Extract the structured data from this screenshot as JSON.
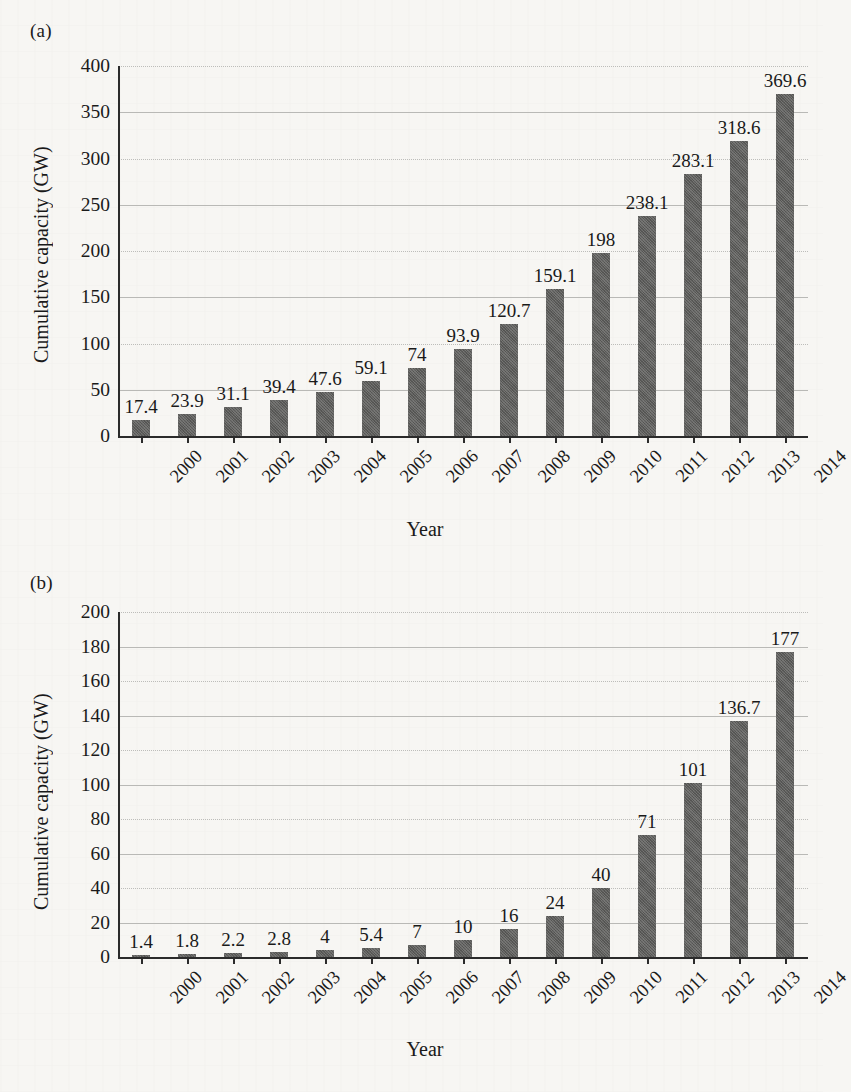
{
  "figure": {
    "panels": [
      {
        "panel_label": "(a)",
        "ylabel": "Cumulative capacity (GW)",
        "xlabel": "Year"
      },
      {
        "panel_label": "(b)",
        "ylabel": "Cumulative capacity (GW)",
        "xlabel": "Year"
      }
    ]
  },
  "chart_data": [
    {
      "type": "bar",
      "panel": "(a)",
      "title": "",
      "xlabel": "Year",
      "ylabel": "Cumulative capacity (GW)",
      "categories": [
        "2000",
        "2001",
        "2002",
        "2003",
        "2004",
        "2005",
        "2006",
        "2007",
        "2008",
        "2009",
        "2010",
        "2011",
        "2012",
        "2013",
        "2014"
      ],
      "values": [
        17.4,
        23.9,
        31.1,
        39.4,
        47.6,
        59.1,
        74,
        93.9,
        120.7,
        159.1,
        198,
        238.1,
        283.1,
        318.6,
        369.6
      ],
      "data_labels": [
        "17.4",
        "23.9",
        "31.1",
        "39.4",
        "47.6",
        "59.1",
        "74",
        "93.9",
        "120.7",
        "159.1",
        "198",
        "238.1",
        "283.1",
        "318.6",
        "369.6"
      ],
      "ylim": [
        0,
        400
      ],
      "yticks": [
        0,
        50,
        100,
        150,
        200,
        250,
        300,
        350,
        400
      ],
      "ytick_labels": [
        "0",
        "50",
        "100",
        "150",
        "200",
        "250",
        "300",
        "350",
        "400"
      ],
      "grid": true,
      "legend": "none",
      "bar_color": "#5d5d5b"
    },
    {
      "type": "bar",
      "panel": "(b)",
      "title": "",
      "xlabel": "Year",
      "ylabel": "Cumulative capacity (GW)",
      "categories": [
        "2000",
        "2001",
        "2002",
        "2003",
        "2004",
        "2005",
        "2006",
        "2007",
        "2008",
        "2009",
        "2010",
        "2011",
        "2012",
        "2013",
        "2014"
      ],
      "values": [
        1.4,
        1.8,
        2.2,
        2.8,
        4,
        5.4,
        7,
        10,
        16,
        24,
        40,
        71,
        101,
        136.7,
        177
      ],
      "data_labels": [
        "1.4",
        "1.8",
        "2.2",
        "2.8",
        "4",
        "5.4",
        "7",
        "10",
        "16",
        "24",
        "40",
        "71",
        "101",
        "136.7",
        "177"
      ],
      "ylim": [
        0,
        200
      ],
      "yticks": [
        0,
        20,
        40,
        60,
        80,
        100,
        120,
        140,
        160,
        180,
        200
      ],
      "ytick_labels": [
        "0",
        "20",
        "40",
        "60",
        "80",
        "100",
        "120",
        "140",
        "160",
        "180",
        "200"
      ],
      "grid": true,
      "legend": "none",
      "bar_color": "#5d5d5b"
    }
  ]
}
